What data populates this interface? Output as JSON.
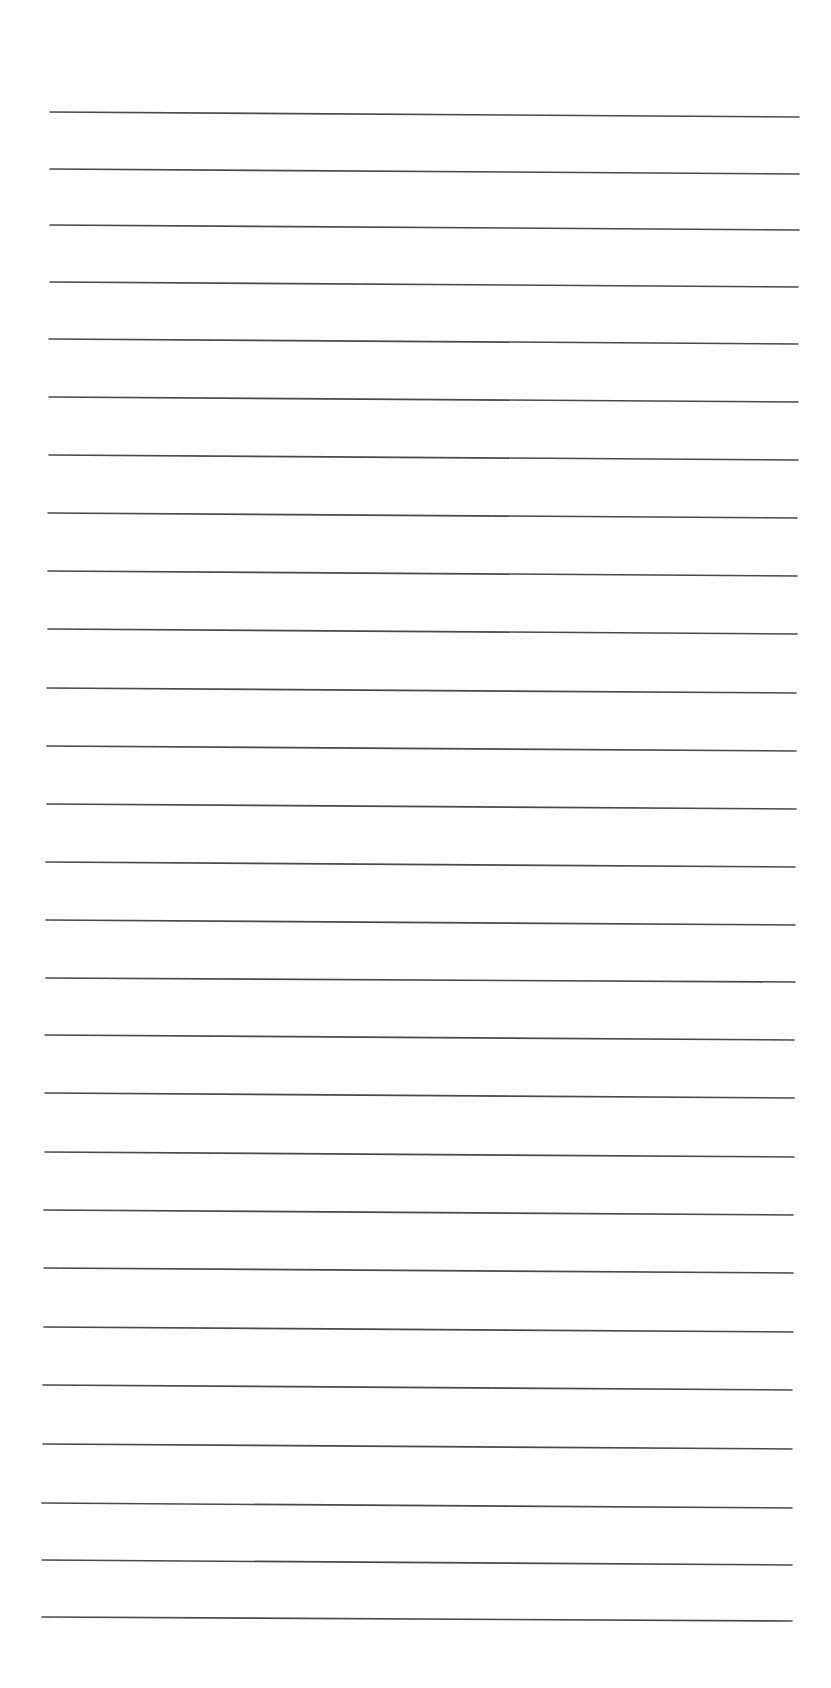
{
  "page": {
    "type": "lined-paper",
    "background_color": "#ffffff",
    "line_color": "#4a4a4a",
    "line_thickness": 1.6,
    "line_count": 27,
    "bleed_through_text": "",
    "lines": [
      {
        "x1": 50,
        "y1": 112,
        "x2": 799,
        "y2": 117
      },
      {
        "x1": 50,
        "y1": 169,
        "x2": 799,
        "y2": 174
      },
      {
        "x1": 50,
        "y1": 225,
        "x2": 799,
        "y2": 230
      },
      {
        "x1": 50,
        "y1": 282,
        "x2": 798,
        "y2": 287
      },
      {
        "x1": 49,
        "y1": 339,
        "x2": 798,
        "y2": 344
      },
      {
        "x1": 49,
        "y1": 397,
        "x2": 798,
        "y2": 402
      },
      {
        "x1": 49,
        "y1": 455,
        "x2": 798,
        "y2": 460
      },
      {
        "x1": 48,
        "y1": 513,
        "x2": 797,
        "y2": 518
      },
      {
        "x1": 48,
        "y1": 571,
        "x2": 797,
        "y2": 576
      },
      {
        "x1": 48,
        "y1": 629,
        "x2": 797,
        "y2": 634
      },
      {
        "x1": 47,
        "y1": 688,
        "x2": 796,
        "y2": 693
      },
      {
        "x1": 47,
        "y1": 746,
        "x2": 796,
        "y2": 751
      },
      {
        "x1": 47,
        "y1": 804,
        "x2": 796,
        "y2": 809
      },
      {
        "x1": 46,
        "y1": 862,
        "x2": 795,
        "y2": 867
      },
      {
        "x1": 46,
        "y1": 920,
        "x2": 795,
        "y2": 925
      },
      {
        "x1": 46,
        "y1": 978,
        "x2": 795,
        "y2": 982
      },
      {
        "x1": 45,
        "y1": 1035,
        "x2": 794,
        "y2": 1040
      },
      {
        "x1": 45,
        "y1": 1093,
        "x2": 794,
        "y2": 1098
      },
      {
        "x1": 45,
        "y1": 1152,
        "x2": 794,
        "y2": 1157
      },
      {
        "x1": 44,
        "y1": 1210,
        "x2": 793,
        "y2": 1215
      },
      {
        "x1": 44,
        "y1": 1268,
        "x2": 793,
        "y2": 1273
      },
      {
        "x1": 44,
        "y1": 1327,
        "x2": 793,
        "y2": 1332
      },
      {
        "x1": 43,
        "y1": 1385,
        "x2": 792,
        "y2": 1390
      },
      {
        "x1": 43,
        "y1": 1444,
        "x2": 792,
        "y2": 1449
      },
      {
        "x1": 42,
        "y1": 1503,
        "x2": 792,
        "y2": 1508
      },
      {
        "x1": 42,
        "y1": 1560,
        "x2": 792,
        "y2": 1565
      },
      {
        "x1": 42,
        "y1": 1617,
        "x2": 792,
        "y2": 1621
      }
    ]
  }
}
